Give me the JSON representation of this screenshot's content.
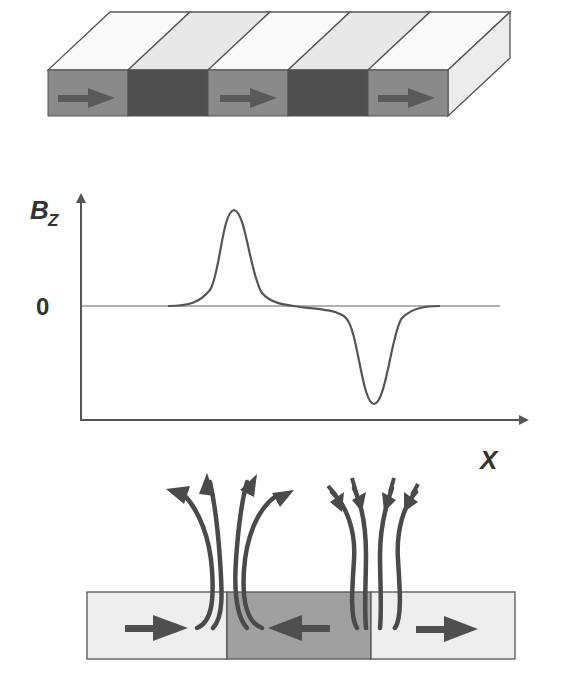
{
  "figure": {
    "type": "magnetic-domain-diagram",
    "colors": {
      "background": "#ffffff",
      "line": "#555555",
      "arrow": "#505050",
      "domain_light_front": "#8a8a8a",
      "domain_dark_front": "#4e4e4e",
      "domain_light_top": "#fafafa",
      "domain_dark_top": "#e6e6e6",
      "side_face": "#eeeeee",
      "cross_section_light": "#eeeeee",
      "cross_section_dark": "#a0a0a0"
    },
    "slab": {
      "description": "3D slab with alternating magnetic domains",
      "domains": [
        {
          "shade": "light",
          "magnetization": "right"
        },
        {
          "shade": "dark",
          "magnetization": "none-visible"
        },
        {
          "shade": "light",
          "magnetization": "right"
        },
        {
          "shade": "dark",
          "magnetization": "none-visible"
        },
        {
          "shade": "light",
          "magnetization": "right"
        }
      ]
    },
    "plot": {
      "y_label_main": "B",
      "y_label_sub": "Z",
      "zero_label": "0",
      "x_label": "X",
      "curve": "positive Gaussian-like peak followed by negative Gaussian-like dip"
    },
    "cross_section": {
      "domains": [
        {
          "shade": "light",
          "magnetization": "right"
        },
        {
          "shade": "dark",
          "magnetization": "left"
        },
        {
          "shade": "light",
          "magnetization": "right"
        }
      ],
      "field_lines": [
        {
          "position": "left-wall",
          "direction": "outward",
          "count": 4
        },
        {
          "position": "right-wall",
          "direction": "inward",
          "count": 4
        }
      ]
    }
  }
}
